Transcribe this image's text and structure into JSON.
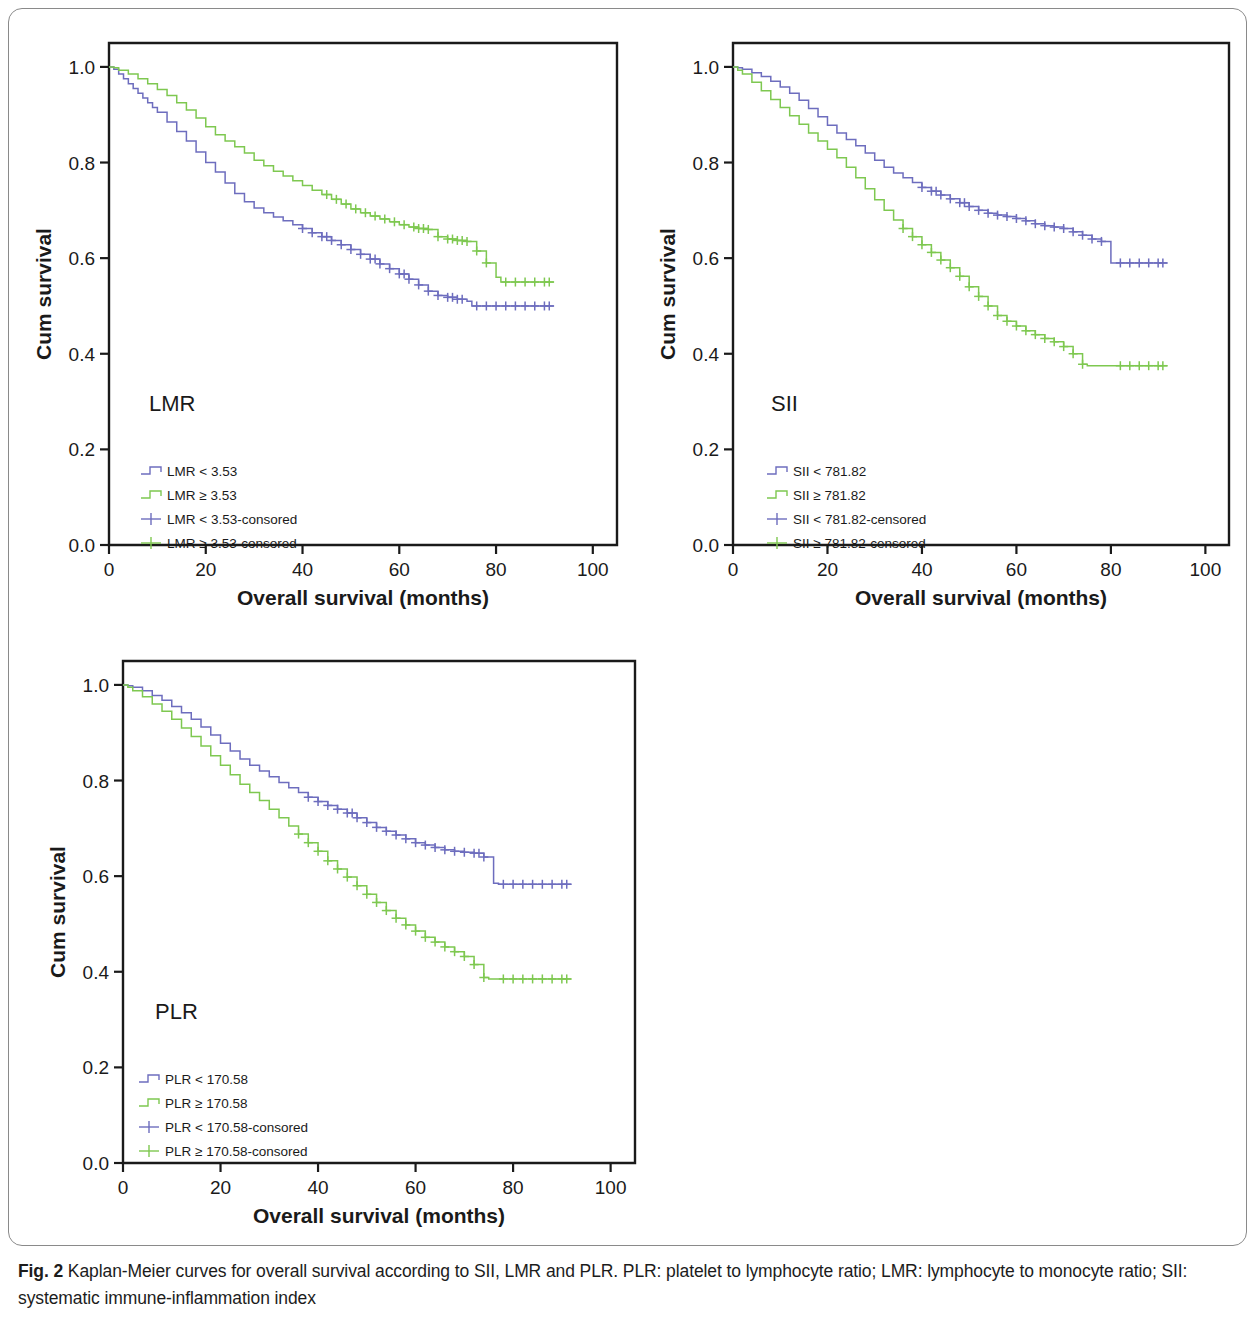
{
  "caption": {
    "label": "Fig. 2",
    "text": " Kaplan-Meier curves for overall survival according to SII, LMR and PLR. PLR: platelet to lymphocyte ratio; LMR: lymphocyte to monocyte ratio; SII: systematic immune-inflammation index"
  },
  "colors": {
    "blue": "#6d6dbe",
    "green": "#7ec850",
    "axis": "#1a1a1a",
    "frame": "#8a8a8a"
  },
  "chart_data": [
    {
      "type": "line",
      "id": "lmr",
      "title": "LMR",
      "xlabel": "Overall survival (months)",
      "ylabel": "Cum survival",
      "xlim": [
        0,
        105
      ],
      "ylim": [
        0.0,
        1.05
      ],
      "xticks": [
        0,
        20,
        40,
        60,
        80,
        100
      ],
      "xtick_labels": [
        "0",
        "20",
        "40",
        "60",
        "80",
        "100"
      ],
      "yticks": [
        0.0,
        0.2,
        0.4,
        0.6,
        0.8,
        1.0
      ],
      "ytick_labels": [
        "0.0",
        "0.2",
        "0.4",
        "0.6",
        "0.8",
        "1.0"
      ],
      "grid": false,
      "legend_position": "lower-left",
      "legend": [
        {
          "label": "LMR < 3.53",
          "color": "#6d6dbe",
          "marker": "step"
        },
        {
          "label": "LMR ≥ 3.53",
          "color": "#7ec850",
          "marker": "step"
        },
        {
          "label": "LMR < 3.53-consored",
          "color": "#6d6dbe",
          "marker": "plus"
        },
        {
          "label": "LMR ≥ 3.53-consored",
          "color": "#7ec850",
          "marker": "plus"
        }
      ],
      "series": [
        {
          "name": "LMR < 3.53",
          "color": "#6d6dbe",
          "x": [
            0,
            1,
            2,
            3,
            4,
            5,
            6,
            7,
            8,
            9,
            10,
            12,
            14,
            16,
            18,
            20,
            22,
            24,
            26,
            28,
            30,
            32,
            34,
            36,
            38,
            40,
            42,
            44,
            46,
            48,
            50,
            52,
            54,
            56,
            58,
            60,
            62,
            64,
            66,
            68,
            70,
            72,
            74,
            75,
            92
          ],
          "y": [
            1.0,
            0.995,
            0.985,
            0.975,
            0.965,
            0.955,
            0.945,
            0.935,
            0.925,
            0.915,
            0.905,
            0.885,
            0.865,
            0.845,
            0.822,
            0.8,
            0.78,
            0.757,
            0.735,
            0.718,
            0.705,
            0.695,
            0.686,
            0.678,
            0.67,
            0.662,
            0.653,
            0.645,
            0.637,
            0.628,
            0.618,
            0.608,
            0.598,
            0.588,
            0.578,
            0.567,
            0.556,
            0.544,
            0.531,
            0.522,
            0.518,
            0.514,
            0.51,
            0.5,
            0.5
          ],
          "censor_x": [
            40,
            42,
            44,
            45,
            46,
            48,
            50,
            52,
            54,
            55,
            56,
            58,
            60,
            61,
            62,
            64,
            66,
            68,
            70,
            71,
            72,
            73,
            76,
            78,
            80,
            82,
            84,
            86,
            88,
            90,
            91
          ],
          "plateau_y": 0.5
        },
        {
          "name": "LMR ≥ 3.53",
          "color": "#7ec850",
          "x": [
            0,
            1,
            2,
            4,
            6,
            8,
            10,
            12,
            14,
            16,
            18,
            20,
            22,
            24,
            26,
            28,
            30,
            32,
            34,
            36,
            38,
            40,
            42,
            44,
            46,
            48,
            50,
            52,
            54,
            56,
            58,
            60,
            62,
            64,
            66,
            68,
            70,
            72,
            74,
            76,
            78,
            80,
            81,
            92
          ],
          "y": [
            1.0,
            0.998,
            0.993,
            0.985,
            0.975,
            0.965,
            0.953,
            0.94,
            0.925,
            0.91,
            0.893,
            0.875,
            0.858,
            0.845,
            0.833,
            0.82,
            0.805,
            0.793,
            0.782,
            0.772,
            0.762,
            0.752,
            0.742,
            0.733,
            0.723,
            0.713,
            0.703,
            0.695,
            0.688,
            0.682,
            0.676,
            0.67,
            0.665,
            0.662,
            0.66,
            0.645,
            0.64,
            0.637,
            0.635,
            0.615,
            0.59,
            0.56,
            0.55,
            0.55
          ],
          "censor_x": [
            45,
            47,
            49,
            51,
            53,
            55,
            57,
            59,
            61,
            63,
            64,
            65,
            66,
            68,
            70,
            71,
            72,
            73,
            74,
            76,
            78,
            82,
            84,
            86,
            88,
            90,
            91
          ],
          "plateau_y": 0.55
        }
      ]
    },
    {
      "type": "line",
      "id": "sii",
      "title": "SII",
      "xlabel": "Overall survival (months)",
      "ylabel": "Cum survival",
      "xlim": [
        0,
        105
      ],
      "ylim": [
        0.0,
        1.05
      ],
      "xticks": [
        0,
        20,
        40,
        60,
        80,
        100
      ],
      "xtick_labels": [
        "0",
        "20",
        "40",
        "60",
        "80",
        "100"
      ],
      "yticks": [
        0.0,
        0.2,
        0.4,
        0.6,
        0.8,
        1.0
      ],
      "ytick_labels": [
        "0.0",
        "0.2",
        "0.4",
        "0.6",
        "0.8",
        "1.0"
      ],
      "grid": false,
      "legend_position": "lower-left",
      "legend": [
        {
          "label": "SII < 781.82",
          "color": "#6d6dbe",
          "marker": "step"
        },
        {
          "label": "SII ≥ 781.82",
          "color": "#7ec850",
          "marker": "step"
        },
        {
          "label": "SII < 781.82-censored",
          "color": "#6d6dbe",
          "marker": "plus"
        },
        {
          "label": "SII ≥ 781.82-censored",
          "color": "#7ec850",
          "marker": "plus"
        }
      ],
      "series": [
        {
          "name": "SII < 781.82",
          "color": "#6d6dbe",
          "x": [
            0,
            1,
            2,
            4,
            6,
            8,
            10,
            12,
            14,
            16,
            18,
            20,
            22,
            24,
            26,
            28,
            30,
            32,
            34,
            36,
            38,
            40,
            42,
            44,
            46,
            48,
            50,
            52,
            54,
            56,
            58,
            60,
            62,
            64,
            66,
            68,
            70,
            72,
            74,
            76,
            78,
            80,
            81,
            92
          ],
          "y": [
            1.0,
            0.998,
            0.995,
            0.988,
            0.98,
            0.97,
            0.958,
            0.945,
            0.93,
            0.913,
            0.896,
            0.878,
            0.862,
            0.848,
            0.835,
            0.82,
            0.805,
            0.79,
            0.778,
            0.768,
            0.758,
            0.748,
            0.74,
            0.732,
            0.724,
            0.716,
            0.708,
            0.7,
            0.694,
            0.69,
            0.687,
            0.683,
            0.678,
            0.672,
            0.668,
            0.665,
            0.662,
            0.655,
            0.648,
            0.64,
            0.635,
            0.59,
            0.59,
            0.59
          ],
          "censor_x": [
            40,
            42,
            43,
            44,
            46,
            48,
            49,
            50,
            52,
            54,
            56,
            58,
            60,
            62,
            64,
            66,
            68,
            70,
            72,
            74,
            76,
            78,
            82,
            84,
            86,
            88,
            90,
            91
          ],
          "plateau_y": 0.59
        },
        {
          "name": "SII ≥ 781.82",
          "color": "#7ec850",
          "x": [
            0,
            1,
            2,
            4,
            6,
            8,
            10,
            12,
            14,
            16,
            18,
            20,
            22,
            24,
            26,
            28,
            30,
            32,
            34,
            36,
            38,
            40,
            42,
            44,
            46,
            48,
            50,
            52,
            54,
            56,
            58,
            60,
            62,
            64,
            66,
            68,
            70,
            72,
            74,
            75,
            92
          ],
          "y": [
            1.0,
            0.993,
            0.985,
            0.968,
            0.95,
            0.932,
            0.915,
            0.898,
            0.88,
            0.862,
            0.845,
            0.828,
            0.81,
            0.79,
            0.768,
            0.745,
            0.722,
            0.7,
            0.68,
            0.662,
            0.645,
            0.628,
            0.612,
            0.596,
            0.58,
            0.562,
            0.54,
            0.52,
            0.5,
            0.48,
            0.468,
            0.458,
            0.448,
            0.44,
            0.432,
            0.425,
            0.415,
            0.4,
            0.378,
            0.375,
            0.375
          ],
          "censor_x": [
            36,
            38,
            40,
            42,
            44,
            46,
            48,
            50,
            52,
            54,
            56,
            58,
            60,
            62,
            64,
            66,
            68,
            70,
            72,
            74,
            82,
            84,
            86,
            88,
            90,
            91
          ],
          "plateau_y": 0.375
        }
      ]
    },
    {
      "type": "line",
      "id": "plr",
      "title": "PLR",
      "xlabel": "Overall survival (months)",
      "ylabel": "Cum survival",
      "xlim": [
        0,
        105
      ],
      "ylim": [
        0.0,
        1.05
      ],
      "xticks": [
        0,
        20,
        40,
        60,
        80,
        100
      ],
      "xtick_labels": [
        "0",
        "20",
        "40",
        "60",
        "80",
        "100"
      ],
      "yticks": [
        0.0,
        0.2,
        0.4,
        0.6,
        0.8,
        1.0
      ],
      "ytick_labels": [
        "0.0",
        "0.2",
        "0.4",
        "0.6",
        "0.8",
        "1.0"
      ],
      "grid": false,
      "legend_position": "lower-left",
      "legend": [
        {
          "label": "PLR < 170.58",
          "color": "#6d6dbe",
          "marker": "step"
        },
        {
          "label": "PLR ≥ 170.58",
          "color": "#7ec850",
          "marker": "step"
        },
        {
          "label": "PLR < 170.58-consored",
          "color": "#6d6dbe",
          "marker": "plus"
        },
        {
          "label": "PLR ≥ 170.58-consored",
          "color": "#7ec850",
          "marker": "plus"
        }
      ],
      "series": [
        {
          "name": "PLR < 170.58",
          "color": "#6d6dbe",
          "x": [
            0,
            1,
            2,
            4,
            6,
            8,
            10,
            12,
            14,
            16,
            18,
            20,
            22,
            24,
            26,
            28,
            30,
            32,
            34,
            36,
            38,
            40,
            42,
            44,
            46,
            48,
            50,
            52,
            54,
            56,
            58,
            60,
            62,
            64,
            66,
            68,
            70,
            72,
            74,
            76,
            77,
            92
          ],
          "y": [
            1.0,
            0.998,
            0.995,
            0.988,
            0.978,
            0.968,
            0.955,
            0.942,
            0.928,
            0.912,
            0.895,
            0.878,
            0.862,
            0.845,
            0.832,
            0.82,
            0.808,
            0.796,
            0.785,
            0.775,
            0.765,
            0.756,
            0.748,
            0.74,
            0.732,
            0.722,
            0.712,
            0.702,
            0.694,
            0.686,
            0.678,
            0.67,
            0.665,
            0.66,
            0.655,
            0.652,
            0.65,
            0.648,
            0.64,
            0.585,
            0.583,
            0.583
          ],
          "censor_x": [
            38,
            40,
            42,
            44,
            46,
            47,
            48,
            50,
            52,
            54,
            56,
            58,
            60,
            62,
            64,
            66,
            68,
            70,
            72,
            73,
            74,
            78,
            80,
            82,
            84,
            86,
            88,
            90,
            91
          ],
          "plateau_y": 0.583
        },
        {
          "name": "PLR ≥ 170.58",
          "color": "#7ec850",
          "x": [
            0,
            1,
            2,
            4,
            6,
            8,
            10,
            12,
            14,
            16,
            18,
            20,
            22,
            24,
            26,
            28,
            30,
            32,
            34,
            36,
            38,
            40,
            42,
            44,
            46,
            48,
            50,
            52,
            54,
            56,
            58,
            60,
            62,
            64,
            66,
            68,
            70,
            72,
            74,
            75,
            92
          ],
          "y": [
            1.0,
            0.995,
            0.988,
            0.975,
            0.96,
            0.945,
            0.928,
            0.91,
            0.892,
            0.872,
            0.852,
            0.832,
            0.812,
            0.792,
            0.775,
            0.758,
            0.74,
            0.722,
            0.705,
            0.688,
            0.67,
            0.652,
            0.632,
            0.615,
            0.598,
            0.58,
            0.562,
            0.545,
            0.528,
            0.512,
            0.498,
            0.485,
            0.472,
            0.462,
            0.452,
            0.442,
            0.432,
            0.415,
            0.388,
            0.385,
            0.385
          ],
          "censor_x": [
            36,
            38,
            40,
            42,
            44,
            46,
            48,
            50,
            52,
            54,
            56,
            58,
            60,
            62,
            64,
            66,
            68,
            70,
            72,
            74,
            78,
            80,
            82,
            84,
            86,
            88,
            90,
            91
          ],
          "plateau_y": 0.385
        }
      ]
    }
  ]
}
